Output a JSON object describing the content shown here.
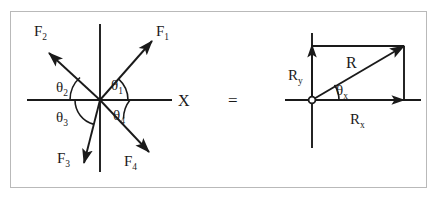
{
  "figure": {
    "top_clipped_text": "",
    "equals_symbol": "=",
    "frame_color": "#b9b9b9",
    "ink_color": "#1a1a1a",
    "background_color": "#ffffff"
  },
  "left_diagram": {
    "name": "concurrent-force-vectors",
    "origin": {
      "x": 100,
      "y": 100
    },
    "axes": {
      "x_axis": {
        "x1": 27,
        "y1": 100,
        "x2": 172,
        "y2": 100,
        "label": "X",
        "label_x": 178,
        "label_y": 106
      },
      "y_axis": {
        "x1": 100,
        "y1": 24,
        "x2": 100,
        "y2": 172,
        "label": ""
      }
    },
    "vectors": [
      {
        "label": "F",
        "subscript": "1",
        "tip": {
          "x": 152,
          "y": 41
        },
        "label_x": 156,
        "label_y": 36,
        "quadrant": "upper-right",
        "approx_angle_deg": 42
      },
      {
        "label": "F",
        "subscript": "2",
        "tip": {
          "x": 49,
          "y": 53
        },
        "label_x": 34,
        "label_y": 36,
        "quadrant": "upper-left",
        "approx_angle_deg": 138
      },
      {
        "label": "F",
        "subscript": "3",
        "tip": {
          "x": 84,
          "y": 163
        },
        "label_x": 57,
        "label_y": 163,
        "quadrant": "lower-left",
        "approx_angle_deg": 255
      },
      {
        "label": "F",
        "subscript": "4",
        "tip": {
          "x": 149,
          "y": 152
        },
        "label_x": 124,
        "label_y": 166,
        "quadrant": "lower-right",
        "approx_angle_deg": 324
      }
    ],
    "angles": [
      {
        "label": "θ",
        "subscript": "1",
        "label_x": 111,
        "label_y": 90,
        "arc_radius": 28,
        "measured_from": "positive-x-axis",
        "to_vector": "F1"
      },
      {
        "label": "θ",
        "subscript": "2",
        "label_x": 58,
        "label_y": 92,
        "arc_radius": 30,
        "measured_from": "negative-x-axis",
        "to_vector": "F2"
      },
      {
        "label": "θ",
        "subscript": "3",
        "label_x": 58,
        "label_y": 120,
        "arc_radius": 25,
        "measured_from": "negative-x-axis",
        "to_vector": "F3"
      },
      {
        "label": "θ",
        "subscript": "4",
        "label_x": 113,
        "label_y": 119,
        "arc_radius": 30,
        "measured_from": "positive-x-axis",
        "to_vector": "F4"
      }
    ]
  },
  "right_diagram": {
    "name": "resultant-vector-components",
    "origin": {
      "x": 312,
      "y": 100
    },
    "axes": {
      "x_axis": {
        "x1": 285,
        "y1": 100,
        "x2": 421,
        "y2": 100
      },
      "y_axis": {
        "x1": 312,
        "y1": 33,
        "x2": 312,
        "y2": 148
      }
    },
    "resultant": {
      "label": "R",
      "label_x": 349,
      "label_y": 66,
      "tip": {
        "x": 404,
        "y": 46
      }
    },
    "components": [
      {
        "label": "R",
        "subscript": "y",
        "label_x": 291,
        "label_y": 78,
        "axis": "vertical",
        "arrow_tip": {
          "x": 312,
          "y": 45
        }
      },
      {
        "label": "R",
        "subscript": "x",
        "label_x": 352,
        "label_y": 122,
        "axis": "horizontal",
        "arrow_tip": {
          "x": 404,
          "y": 100
        }
      }
    ],
    "angle": {
      "label": "θ",
      "subscript": "x",
      "label_x": 338,
      "label_y": 94,
      "arc_radius": 27,
      "measured_from": "positive-x-axis",
      "to_vector": "R"
    },
    "rectangle": {
      "x": 312,
      "y": 46,
      "width": 92,
      "height": 54
    }
  }
}
